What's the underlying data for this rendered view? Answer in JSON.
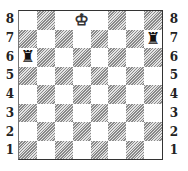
{
  "board": {
    "ranks": [
      "8",
      "7",
      "6",
      "5",
      "4",
      "3",
      "2",
      "1"
    ],
    "files": [
      "a",
      "b",
      "c",
      "d",
      "e",
      "f",
      "g",
      "h"
    ],
    "colors": {
      "light": "#ffffff",
      "dark_hatch": "#8a8a8a",
      "border": "#333333"
    },
    "pieces": [
      {
        "square": "d8",
        "type": "king",
        "color": "white",
        "glyph": "♔"
      },
      {
        "square": "h7",
        "type": "rook",
        "color": "black",
        "glyph": "♜"
      },
      {
        "square": "a6",
        "type": "rook",
        "color": "black",
        "glyph": "♜"
      }
    ]
  },
  "labels": {
    "left": [
      "8",
      "7",
      "6",
      "5",
      "4",
      "3",
      "2",
      "1"
    ],
    "right": [
      "8",
      "7",
      "6",
      "5",
      "4",
      "3",
      "2",
      "1"
    ]
  }
}
